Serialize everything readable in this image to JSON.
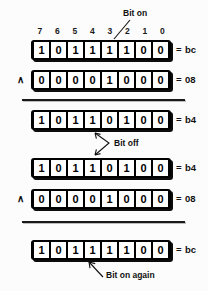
{
  "figure": {
    "bit_labels": [
      "7",
      "6",
      "5",
      "4",
      "3",
      "2",
      "1",
      "0"
    ],
    "and_operator": "∧",
    "equals_sign": "="
  },
  "annotations": {
    "bit_on": "Bit on",
    "bit_off": "Bit off",
    "bit_on_again": "Bit on again"
  },
  "groups": [
    {
      "name": "group-one",
      "rows": [
        {
          "name": "row-value-bc-top",
          "operator": "",
          "bits": [
            "1",
            "0",
            "1",
            "1",
            "1",
            "1",
            "0",
            "0"
          ],
          "hex": "bc"
        },
        {
          "name": "row-mask-08-top",
          "operator": "∧",
          "bits": [
            "0",
            "0",
            "0",
            "0",
            "1",
            "0",
            "0",
            "0"
          ],
          "hex": "08"
        }
      ]
    },
    {
      "name": "group-two",
      "rows": [
        {
          "name": "row-value-b4-upper",
          "operator": "",
          "bits": [
            "1",
            "0",
            "1",
            "1",
            "0",
            "1",
            "0",
            "0"
          ],
          "hex": "b4"
        },
        {
          "name": "row-value-b4-lower",
          "operator": "",
          "bits": [
            "1",
            "0",
            "1",
            "1",
            "0",
            "1",
            "0",
            "0"
          ],
          "hex": "b4"
        },
        {
          "name": "row-mask-08-bottom",
          "operator": "∧",
          "bits": [
            "0",
            "0",
            "0",
            "0",
            "1",
            "0",
            "0",
            "0"
          ],
          "hex": "08"
        }
      ]
    },
    {
      "name": "group-three",
      "rows": [
        {
          "name": "row-value-bc-bottom",
          "operator": "",
          "bits": [
            "1",
            "0",
            "1",
            "1",
            "1",
            "1",
            "0",
            "0"
          ],
          "hex": "bc"
        }
      ]
    }
  ],
  "colors": {
    "background": "#fcfcfc",
    "ink": "#111111",
    "box_fill": "#000000",
    "cell_fill": "#ffffff"
  }
}
